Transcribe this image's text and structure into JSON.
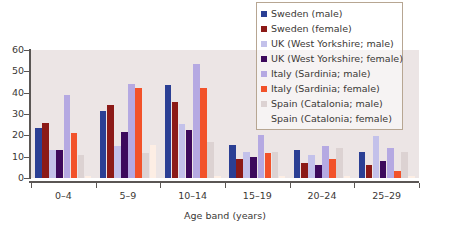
{
  "chart_data": {
    "type": "bar",
    "title": "",
    "subtitle": "",
    "xlabel": "Age band (years)",
    "ylabel": "",
    "categories": [
      "0–4",
      "5–9",
      "10–14",
      "15–19",
      "20–24",
      "25–29"
    ],
    "ylim": [
      0,
      60
    ],
    "yticks": [
      0,
      10,
      20,
      30,
      40,
      50,
      60
    ],
    "ytick_labels": [
      "0",
      "10",
      "20",
      "30",
      "40",
      "50",
      "60"
    ],
    "grid": false,
    "legend_position": "top-right",
    "series": [
      {
        "name": "Sweden (male)",
        "color": "#2b3f94",
        "values": [
          23.5,
          31.5,
          43.4,
          15.6,
          13.2,
          12.0
        ]
      },
      {
        "name": "Sweden (female)",
        "color": "#8c1a17",
        "values": [
          25.7,
          34.3,
          35.4,
          9.1,
          7.0,
          6.2
        ]
      },
      {
        "name": "UK (West Yorkshire; male)",
        "color": "#c3c1ea",
        "values": [
          12.9,
          15.1,
          25.5,
          12.0,
          10.8,
          19.8
        ]
      },
      {
        "name": "UK (West Yorkshire; female)",
        "color": "#3d0a5c",
        "values": [
          13.2,
          21.7,
          22.3,
          9.9,
          6.1,
          7.8
        ]
      },
      {
        "name": "Italy (Sardinia; male)",
        "color": "#b5a9e2",
        "values": [
          38.9,
          44.2,
          53.6,
          20.0,
          15.2,
          14.2
        ]
      },
      {
        "name": "Italy (Sardinia; female)",
        "color": "#f2522a",
        "values": [
          20.9,
          42.3,
          42.1,
          11.8,
          8.8,
          3.1
        ]
      },
      {
        "name": "Spain (Catalonia; male)",
        "color": "#dcd2d2",
        "values": [
          11.0,
          11.9,
          16.7,
          12.4,
          14.3,
          12.4
        ]
      },
      {
        "name": "Spain (Catalonia; female)",
        "color": "#fdeee4",
        "values": [
          1.0,
          15.6,
          1.0,
          1.0,
          1.0,
          1.0
        ]
      }
    ]
  },
  "legend": {
    "items": [
      {
        "label": "Sweden (male)",
        "color": "#2b3f94",
        "swatch": true
      },
      {
        "label": "Sweden (female)",
        "color": "#8c1a17",
        "swatch": true
      },
      {
        "label": "UK (West Yorkshire; male)",
        "color": "#c3c1ea",
        "swatch": true
      },
      {
        "label": "UK (West Yorkshire; female)",
        "color": "#3d0a5c",
        "swatch": true
      },
      {
        "label": "Italy (Sardinia; male)",
        "color": "#b5a9e2",
        "swatch": true
      },
      {
        "label": "Italy (Sardinia; female)",
        "color": "#f2522a",
        "swatch": true
      },
      {
        "label": "Spain (Catalonia; male)",
        "color": "#dcd2d2",
        "swatch": true
      },
      {
        "label": "Spain (Catalonia; female)",
        "color": "#fdeee4",
        "swatch": false
      }
    ]
  },
  "colors": {
    "plot_background": "#ece5e5",
    "axis": "#5a5654",
    "text": "#3b3836",
    "legend_border": "#b7a692"
  }
}
